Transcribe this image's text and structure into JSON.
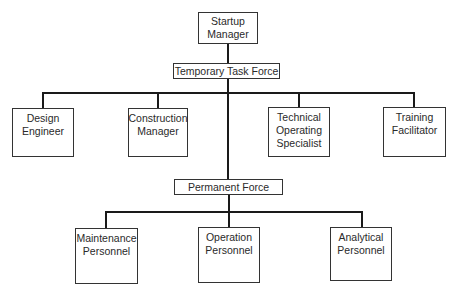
{
  "diagram": {
    "type": "org-chart",
    "top": {
      "id": "startup-manager",
      "lines": [
        "Startup",
        "Manager"
      ]
    },
    "temporary": {
      "id": "temporary-task-force",
      "lines": [
        "Temporary Task Force"
      ],
      "children": [
        {
          "id": "design-engineer",
          "lines": [
            "Design",
            "Engineer"
          ]
        },
        {
          "id": "construction-manager",
          "lines": [
            "Construction",
            "Manager"
          ]
        },
        {
          "id": "technical-operating-specialist",
          "lines": [
            "Technical",
            "Operating",
            "Specialist"
          ]
        },
        {
          "id": "training-facilitator",
          "lines": [
            "Training",
            "Facilitator"
          ]
        }
      ]
    },
    "permanent": {
      "id": "permanent-force",
      "lines": [
        "Permanent Force"
      ],
      "children": [
        {
          "id": "maintenance-personnel",
          "lines": [
            "Maintenance",
            "Personnel"
          ]
        },
        {
          "id": "operation-personnel",
          "lines": [
            "Operation",
            "Personnel"
          ]
        },
        {
          "id": "analytical-personnel",
          "lines": [
            "Analytical",
            "Personnel"
          ]
        }
      ]
    }
  }
}
